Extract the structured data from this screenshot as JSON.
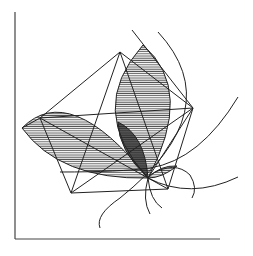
{
  "figure": {
    "axes": {
      "x_axis": "horizontal baseline",
      "y_axis": "vertical left line"
    },
    "colors": {
      "line": "#222222",
      "hatch": "#555555",
      "axis": "#444444",
      "dark_overlap": "#333333",
      "background": "#ffffff"
    },
    "points": {
      "top": [
        120,
        52
      ],
      "left": [
        40,
        118
      ],
      "bottom_left": [
        71,
        193
      ],
      "center": [
        148,
        178
      ],
      "right": [
        193,
        108
      ],
      "bottom_right": [
        168,
        189
      ]
    },
    "shapes": [
      "pentagon",
      "lens-left",
      "lens-upper",
      "lens-small-right",
      "arc-large-right",
      "arc-outer-right",
      "arc-bottom-left",
      "arc-small-circle"
    ]
  }
}
